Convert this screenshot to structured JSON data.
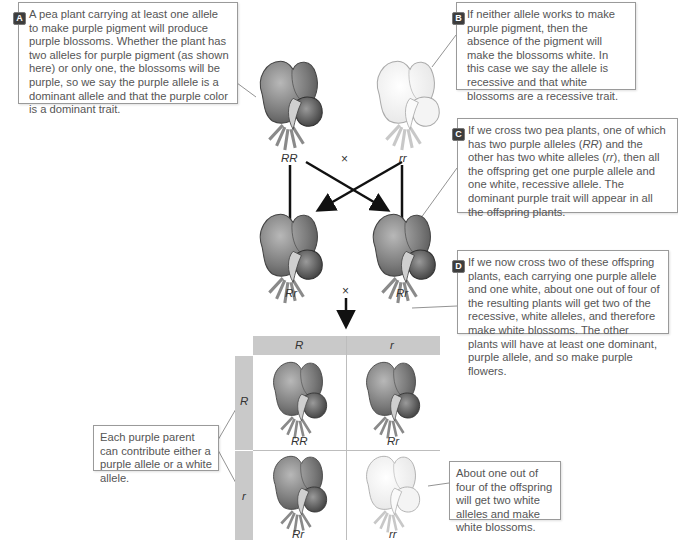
{
  "callouts": {
    "A": {
      "badge": "A",
      "text": "A pea plant carrying at least one allele to make purple pigment will produce purple blossoms. Whether the plant has two alleles for purple pigment (as shown here) or only one, the blossoms will be purple, so we say the purple allele is a dominant allele and that the purple color is a dominant trait."
    },
    "B": {
      "badge": "B",
      "text": "If neither allele works to make purple pigment, then the absence of the pigment will make the blossoms white. In this case we say the allele is recessive and that white blossoms are a recessive trait."
    },
    "C": {
      "badge": "C",
      "text_parts": [
        "If we cross two pea plants, one of which has two purple alleles (",
        "RR",
        ") and the other has two white alleles (",
        "rr",
        "), then all the offspring get one purple allele and one white, recessive allele. The dominant purple trait will appear in all the offspring plants."
      ]
    },
    "D": {
      "badge": "D",
      "text": "If we now cross two of these offspring plants, each carrying one purple allele and one white, about one out of four of the resulting plants will get two of the recessive, white alleles, and therefore make white blossoms. The other plants will have at least one dominant, purple allele, and so make purple flowers."
    },
    "parent_note": "Each purple parent can contribute either a purple allele or a white allele.",
    "white_note": "About one out of four of the offspring will get two white alleles and make white blossoms."
  },
  "parents": {
    "left_genotype": "RR",
    "right_genotype": "rr",
    "cross_symbol": "×"
  },
  "f1": {
    "left_genotype": "Rr",
    "right_genotype": "Rr",
    "cross_symbol": "×"
  },
  "punnett": {
    "col_headers": [
      "R",
      "r"
    ],
    "row_headers": [
      "R",
      "r"
    ],
    "cells": [
      [
        "RR",
        "Rr"
      ],
      [
        "Rr",
        "rr"
      ]
    ],
    "cell_colors": [
      [
        "purple",
        "purple"
      ],
      [
        "purple",
        "white"
      ]
    ]
  },
  "colors": {
    "purple_flower_dark": "#5a5a5a",
    "purple_flower_light": "#a8a8a8",
    "white_flower_stroke": "#b5b5b5",
    "header_bar": "#c9c9c9",
    "callout_border": "#9a9a9a",
    "badge_bg": "#3d3d3d"
  }
}
